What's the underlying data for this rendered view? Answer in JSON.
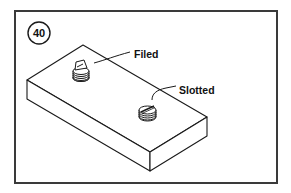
{
  "figure": {
    "number": "40",
    "labels": {
      "filed": "Filed",
      "slotted": "Slotted"
    },
    "colors": {
      "line": "#1a1a1a",
      "frame": "#3a3a3a",
      "background": "#ffffff"
    }
  }
}
